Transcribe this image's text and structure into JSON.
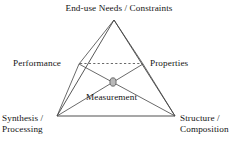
{
  "diagram": {
    "nodes": {
      "apex": {
        "label": "End-use Needs / Constraints",
        "x": 114,
        "y": 20
      },
      "left_mid": {
        "label": "Performance",
        "x": 79,
        "y": 64
      },
      "right_mid": {
        "label": "Properties",
        "x": 143,
        "y": 64
      },
      "bottom_left": {
        "label_line1": "Synthesis /",
        "label_line2": "Processing",
        "x": 57,
        "y": 116
      },
      "bottom_right": {
        "label_line1": "Structure /",
        "label_line2": "Composition",
        "x": 175,
        "y": 116
      },
      "center": {
        "label": "Measurement",
        "x": 113,
        "y": 82
      }
    },
    "edges": [
      {
        "name": "apex-to-bottom-left",
        "style": "solid"
      },
      {
        "name": "apex-to-bottom-right",
        "style": "solid"
      },
      {
        "name": "apex-to-performance",
        "style": "solid"
      },
      {
        "name": "apex-to-properties",
        "style": "solid"
      },
      {
        "name": "performance-to-properties",
        "style": "dashed"
      },
      {
        "name": "performance-to-bottom-left",
        "style": "solid"
      },
      {
        "name": "properties-to-bottom-right",
        "style": "solid"
      },
      {
        "name": "performance-to-bottom-right",
        "style": "solid"
      },
      {
        "name": "properties-to-bottom-left",
        "style": "solid"
      },
      {
        "name": "bottom-left-to-bottom-right",
        "style": "solid-thick"
      }
    ],
    "colors": {
      "line": "#444444",
      "baseline": "#8a8a8a",
      "center_node_fill": "#b8b8b8",
      "center_node_stroke": "#555555",
      "text": "#141414",
      "background": "#ffffff"
    }
  }
}
